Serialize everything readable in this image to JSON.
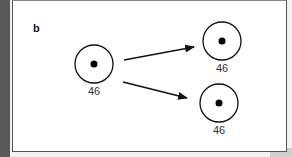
{
  "panel": {
    "label": "b"
  },
  "cells": [
    {
      "id": "parent",
      "chromosome_count": "46",
      "cx": 94,
      "cy": 64,
      "r": 19,
      "label_x": 94,
      "label_y": 85
    },
    {
      "id": "daughter-top",
      "chromosome_count": "46",
      "cx": 222,
      "cy": 41,
      "r": 19,
      "label_x": 222,
      "label_y": 62
    },
    {
      "id": "daughter-bottom",
      "chromosome_count": "46",
      "cx": 219,
      "cy": 103,
      "r": 19,
      "label_x": 219,
      "label_y": 124
    }
  ],
  "arrows": [
    {
      "from": "parent",
      "to": "daughter-top"
    },
    {
      "from": "parent",
      "to": "daughter-bottom"
    }
  ],
  "colors": {
    "stroke": "#111111",
    "background": "#ffffff",
    "left_strip": "#595959"
  }
}
